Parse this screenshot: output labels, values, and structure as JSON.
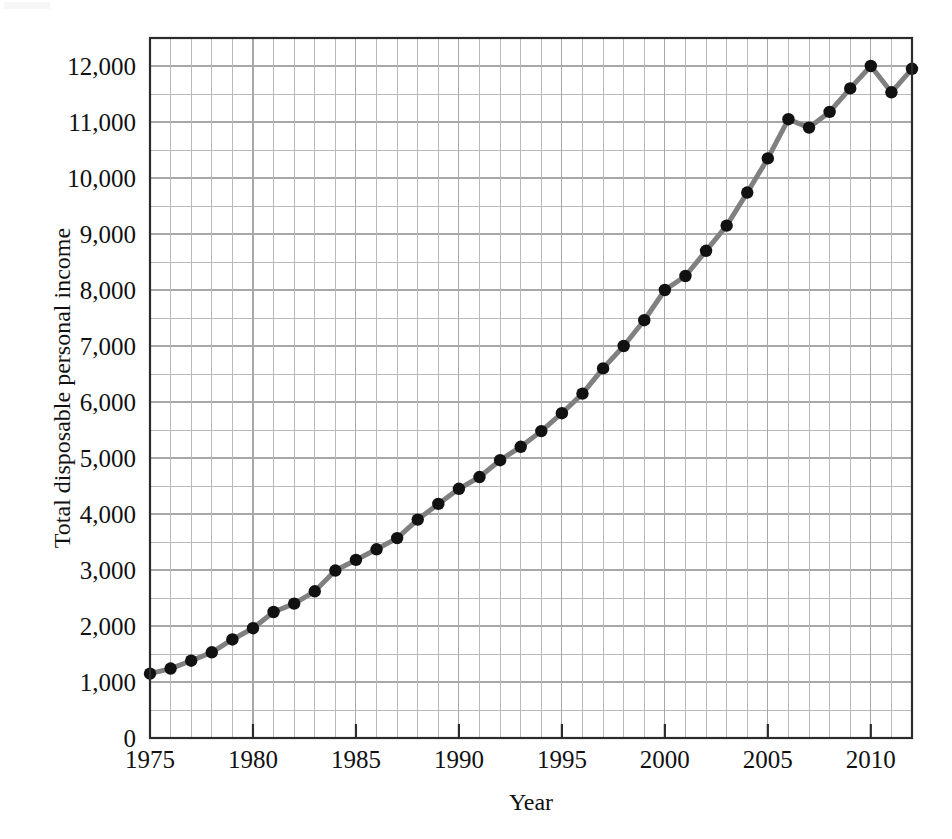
{
  "figure": {
    "background_color": "#ffffff",
    "line_color": "#808080",
    "marker_color": "#111111",
    "frame_color": "#2b2b2b",
    "grid_color": "#b9b9b9"
  },
  "chart_data": {
    "type": "line",
    "title": "",
    "xlabel": "Year",
    "ylabel": "Total disposable personal income",
    "xlim": [
      1975,
      2012
    ],
    "ylim": [
      0,
      12500
    ],
    "grid": true,
    "legend": "none",
    "x_tick_labels": [
      "1975",
      "1980",
      "1985",
      "1990",
      "1995",
      "2000",
      "2005",
      "2010"
    ],
    "x_ticks": [
      1975,
      1980,
      1985,
      1990,
      1995,
      2000,
      2005,
      2010
    ],
    "y_tick_labels": [
      "0",
      "1,000",
      "2,000",
      "3,000",
      "4,000",
      "5,000",
      "6,000",
      "7,000",
      "8,000",
      "9,000",
      "10,000",
      "11,000",
      "12,000"
    ],
    "y_ticks": [
      0,
      1000,
      2000,
      3000,
      4000,
      5000,
      6000,
      7000,
      8000,
      9000,
      10000,
      11000,
      12000
    ],
    "y_minor_step": 500,
    "x_minor_step": 1,
    "marker": "filled-circle",
    "x": [
      1975,
      1976,
      1977,
      1978,
      1979,
      1980,
      1981,
      1982,
      1983,
      1984,
      1985,
      1986,
      1987,
      1988,
      1989,
      1990,
      1991,
      1992,
      1993,
      1994,
      1995,
      1996,
      1997,
      1998,
      1999,
      2000,
      2001,
      2002,
      2003,
      2004,
      2005,
      2006,
      2007,
      2008,
      2009,
      2010,
      2011,
      2012
    ],
    "values": [
      1150,
      1240,
      1380,
      1530,
      1760,
      1960,
      2250,
      2400,
      2620,
      2990,
      3180,
      3370,
      3570,
      3900,
      4180,
      4450,
      4660,
      4960,
      5200,
      5480,
      5800,
      6150,
      6600,
      7000,
      7460,
      8000,
      8250,
      8700,
      9150,
      9740,
      10350,
      11050,
      10900,
      11180,
      11600,
      12000,
      11530,
      11950
    ],
    "series": [
      {
        "name": "Total disposable personal income",
        "values": [
          1150,
          1240,
          1380,
          1530,
          1760,
          1960,
          2250,
          2400,
          2620,
          2990,
          3180,
          3370,
          3570,
          3900,
          4180,
          4450,
          4660,
          4960,
          5200,
          5480,
          5800,
          6150,
          6600,
          7000,
          7460,
          8000,
          8250,
          8700,
          9150,
          9740,
          10350,
          11050,
          10900,
          11180,
          11600,
          12000,
          11530,
          11950
        ]
      }
    ]
  }
}
